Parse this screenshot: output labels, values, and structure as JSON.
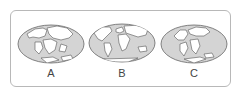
{
  "figure": {
    "colors": {
      "ocean": "#d4d4d4",
      "land": "#ffffff",
      "outline": "#555555",
      "frame": "#b8b8b8"
    },
    "maps": [
      {
        "label": "A",
        "description": "Pangaea-like supercontinent map (early)"
      },
      {
        "label": "B",
        "description": "Present-day world map"
      },
      {
        "label": "C",
        "description": "Intermediate continental arrangement"
      }
    ]
  }
}
